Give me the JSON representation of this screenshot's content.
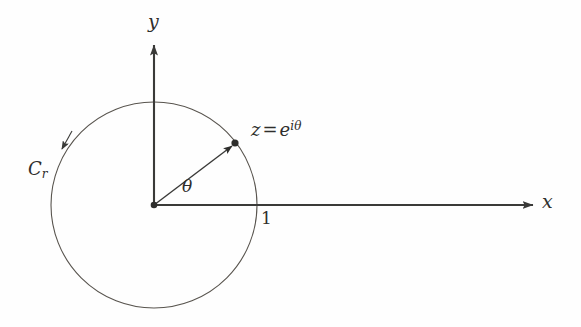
{
  "figure": {
    "background_color": "#fefefe",
    "axis_color": "#3a3a38",
    "curve_color": "#58544e",
    "text_color": "#2e2e2c"
  },
  "labels": {
    "y_axis": "y",
    "x_axis": "x",
    "angle": "θ",
    "unit_mark": "1",
    "contour_main": "C",
    "contour_sub": "r",
    "point_z_var": "z",
    "point_z_equals": "=",
    "point_z_base": "e",
    "point_z_exponent": "iθ"
  },
  "geometry": {
    "origin_x": 154,
    "origin_y": 205,
    "circle_radius": 103,
    "point_z_x": 235,
    "point_z_y": 143,
    "angle_degrees": 37,
    "x_axis_tip_x": 533,
    "y_axis_tip_y": 45,
    "circle_direction": "counterclockwise",
    "unit_intersection_x": 257
  }
}
